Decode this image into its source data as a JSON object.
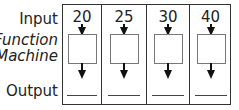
{
  "labels": {
    "input": "Input",
    "function_line1": "Function",
    "function_line2": "Machine",
    "output": "Output"
  },
  "columns": [
    {
      "input": "20",
      "output": ""
    },
    {
      "input": "25",
      "output": ""
    },
    {
      "input": "30",
      "output": ""
    },
    {
      "input": "40",
      "output": ""
    }
  ],
  "colors": {
    "border": "#333333",
    "box_border": "#777777",
    "arrow": "#111111",
    "text": "#222222"
  }
}
